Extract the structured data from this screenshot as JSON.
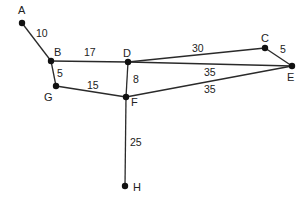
{
  "diagram": {
    "type": "weighted-undirected-graph",
    "nodes": [
      {
        "id": "A",
        "x": 22,
        "y": 23,
        "lx": 18,
        "ly": 14
      },
      {
        "id": "B",
        "x": 51,
        "y": 61,
        "lx": 54,
        "ly": 56
      },
      {
        "id": "G",
        "x": 56,
        "y": 86,
        "lx": 44,
        "ly": 101
      },
      {
        "id": "D",
        "x": 128,
        "y": 62,
        "lx": 123,
        "ly": 57
      },
      {
        "id": "F",
        "x": 126,
        "y": 97,
        "lx": 131,
        "ly": 106
      },
      {
        "id": "C",
        "x": 265,
        "y": 48,
        "lx": 261,
        "ly": 42
      },
      {
        "id": "E",
        "x": 292,
        "y": 66,
        "lx": 287,
        "ly": 81
      },
      {
        "id": "H",
        "x": 125,
        "y": 186,
        "lx": 133,
        "ly": 191
      }
    ],
    "edges": [
      {
        "from": "A",
        "to": "B",
        "weight": "10",
        "lx": 36,
        "ly": 37
      },
      {
        "from": "B",
        "to": "D",
        "weight": "17",
        "lx": 84,
        "ly": 56
      },
      {
        "from": "B",
        "to": "G",
        "weight": "5",
        "lx": 57,
        "ly": 77
      },
      {
        "from": "G",
        "to": "F",
        "weight": "15",
        "lx": 87,
        "ly": 89
      },
      {
        "from": "D",
        "to": "F",
        "weight": "8",
        "lx": 133,
        "ly": 83
      },
      {
        "from": "D",
        "to": "C",
        "weight": "30",
        "lx": 192,
        "ly": 52
      },
      {
        "from": "D",
        "to": "E",
        "weight": "35",
        "lx": 204,
        "ly": 76
      },
      {
        "from": "F",
        "to": "E",
        "weight": "35",
        "lx": 204,
        "ly": 93
      },
      {
        "from": "C",
        "to": "E",
        "weight": "5",
        "lx": 280,
        "ly": 53
      },
      {
        "from": "F",
        "to": "H",
        "weight": "25",
        "lx": 130,
        "ly": 146
      }
    ]
  }
}
